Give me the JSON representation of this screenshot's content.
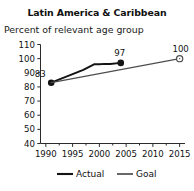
{
  "chart_data": {
    "type": "line",
    "title": "Latin America & Caribbean",
    "subtitle": "Percent of relevant age group",
    "xlabel": "",
    "ylabel": "",
    "xlim": [
      1989,
      2016
    ],
    "ylim": [
      40,
      110
    ],
    "ytick_step": 10,
    "xtick_step": 5,
    "grid": false,
    "legend_position": "bottom",
    "yticks": [
      "110",
      "100",
      "90",
      "80",
      "70",
      "60",
      "50",
      "40"
    ],
    "ytick_values": [
      110,
      100,
      90,
      80,
      70,
      60,
      50,
      40
    ],
    "xticks": [
      "1990",
      "1995",
      "2000",
      "2005",
      "2010",
      "2015"
    ],
    "xtick_values": [
      1990,
      1995,
      2000,
      2005,
      2010,
      2015
    ],
    "series": [
      {
        "name": "Actual",
        "color": "#141414",
        "marker": "filled-circle",
        "x": [
          1991,
          1993,
          1995,
          1997,
          1999,
          2000,
          2001,
          2002,
          2004
        ],
        "values": [
          83,
          86,
          89,
          92,
          96,
          96,
          96.3,
          96.2,
          97
        ],
        "point_labels": [
          {
            "x": 1991,
            "y": 83,
            "text": "83"
          },
          {
            "x": 2004,
            "y": 97,
            "text": "97"
          }
        ],
        "markers_at": [
          1991,
          2004
        ]
      },
      {
        "name": "Goal",
        "color": "#4d4d4d",
        "marker": "open-circle",
        "x": [
          1991,
          2015
        ],
        "values": [
          83,
          100
        ],
        "point_labels": [
          {
            "x": 2015,
            "y": 100,
            "text": "100"
          }
        ],
        "markers_at": [
          2015
        ]
      }
    ],
    "annotations": [
      "83",
      "97",
      "100"
    ]
  },
  "legend": {
    "items": [
      {
        "label": "Actual",
        "color": "#141414"
      },
      {
        "label": "Goal",
        "color": "#4d4d4d"
      }
    ]
  }
}
